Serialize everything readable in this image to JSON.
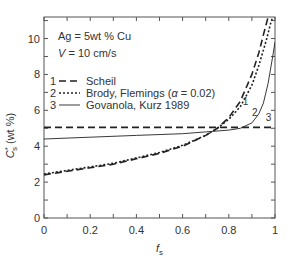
{
  "chart_data": {
    "type": "line",
    "title": "",
    "annotations": [
      "Ag = 5wt % Cu",
      "V = 10 cm/s"
    ],
    "xlabel": "f_s",
    "ylabel": "C*_s (wt %)",
    "xlim": [
      0,
      1
    ],
    "ylim": [
      0,
      11.2
    ],
    "x_ticks": [
      "0",
      "0.2",
      "0.4",
      "0.6",
      "0.8",
      "1"
    ],
    "y_ticks": [
      "0",
      "2",
      "4",
      "6",
      "8",
      "10"
    ],
    "grid": false,
    "legend_position": "upper-left",
    "series": [
      {
        "id": "1",
        "name": "Scheil",
        "style": "dashed",
        "x": [
          0,
          0.1,
          0.2,
          0.3,
          0.4,
          0.5,
          0.6,
          0.7,
          0.75,
          0.8,
          0.85,
          0.9,
          0.93,
          0.95,
          0.97,
          0.98
        ],
        "y": [
          2.4,
          2.6,
          2.8,
          3.0,
          3.3,
          3.6,
          4.0,
          4.6,
          5.0,
          5.6,
          6.5,
          8.0,
          9.2,
          10.2,
          11.2,
          11.2
        ]
      },
      {
        "id": "2",
        "name": "Brody, Flemings (α = 0.02)",
        "style": "dotted",
        "x": [
          0,
          0.1,
          0.2,
          0.3,
          0.4,
          0.5,
          0.6,
          0.7,
          0.75,
          0.8,
          0.85,
          0.9,
          0.93,
          0.96,
          0.98,
          0.99
        ],
        "y": [
          2.45,
          2.65,
          2.85,
          3.05,
          3.35,
          3.65,
          4.05,
          4.6,
          5.0,
          5.5,
          6.2,
          7.4,
          8.5,
          9.8,
          10.8,
          11.2
        ]
      },
      {
        "id": "3",
        "name": "Govanola, Kurz 1989",
        "style": "solid",
        "x": [
          0,
          0.2,
          0.4,
          0.6,
          0.7,
          0.8,
          0.85,
          0.9,
          0.93,
          0.95,
          0.97,
          0.99,
          1.0
        ],
        "y": [
          4.4,
          4.5,
          4.6,
          4.7,
          4.8,
          4.9,
          5.0,
          5.3,
          5.8,
          6.4,
          7.5,
          9.0,
          9.8
        ]
      },
      {
        "id": "scheil-equilibrium",
        "name": "",
        "style": "dashed",
        "x": [
          0,
          1
        ],
        "y": [
          5.05,
          5.05
        ]
      }
    ],
    "curve_labels": [
      {
        "text": "1",
        "x": 0.86,
        "y": 6.3
      },
      {
        "text": "2",
        "x": 0.9,
        "y": 5.7
      },
      {
        "text": "3",
        "x": 0.96,
        "y": 5.4
      }
    ]
  },
  "legend": [
    {
      "num": "1",
      "label": "Scheil"
    },
    {
      "num": "2",
      "label": "Brody, Flemings (α = 0.02)"
    },
    {
      "num": "3",
      "label": "Govanola, Kurz 1989"
    }
  ],
  "annotation": {
    "line1": "Ag = 5wt % Cu",
    "line2": "V = 10 cm/s"
  }
}
